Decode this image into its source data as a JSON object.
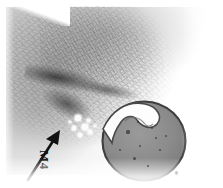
{
  "figure": {
    "type": "micrograph",
    "modality": "histology-light-micrograph",
    "stain_tone": "grayscale",
    "background_color": "#ffffff",
    "tissue_mid_tone": "#8e8e8e",
    "tissue_dark_tone": "#3a3a3a",
    "caption": ""
  },
  "annotations": {
    "label": {
      "text": "M4",
      "orientation": "rotated-90-clockwise",
      "color": "#111111",
      "x": 58,
      "y": 150
    },
    "arrow": {
      "name": "pointer-arrow",
      "color": "#111111",
      "tail_x": 30,
      "tail_y": 178,
      "tip_x": 60,
      "tip_y": 132,
      "direction": "up-right"
    },
    "speck": {
      "name": "dust-speck",
      "x": 176,
      "y": 172
    }
  },
  "structures": {
    "round_body": {
      "name": "round-follicular-body",
      "outline_color": "#3d3d3d",
      "fill_color": "#8b8b8b",
      "cx": 144,
      "cy": 140,
      "rx": 43,
      "ry": 42
    },
    "hook": {
      "name": "internal-hook-structure",
      "fill_color": "#fdfdfd",
      "outline_color": "#4a4a4a"
    },
    "lesion_band": {
      "name": "dark-diagonal-lesion-band",
      "color": "#2e2e2e",
      "angle_deg": 11
    },
    "bone_field": {
      "name": "trabecular-bone-field",
      "texture": "speckled"
    },
    "vacuoles": [
      {
        "x": 78,
        "y": 118,
        "r": 3.2
      },
      {
        "x": 85,
        "y": 127,
        "r": 2.6
      },
      {
        "x": 80,
        "y": 135,
        "r": 2.2
      },
      {
        "x": 90,
        "y": 132,
        "r": 1.8
      },
      {
        "x": 74,
        "y": 128,
        "r": 1.6
      },
      {
        "x": 88,
        "y": 120,
        "r": 1.5
      },
      {
        "x": 95,
        "y": 126,
        "r": 1.4
      },
      {
        "x": 70,
        "y": 122,
        "r": 1.3
      }
    ],
    "interior_specks": [
      {
        "x": 128,
        "y": 132,
        "r": 1.6
      },
      {
        "x": 140,
        "y": 146,
        "r": 1.3
      },
      {
        "x": 152,
        "y": 128,
        "r": 1.2
      },
      {
        "x": 134,
        "y": 158,
        "r": 1.5
      },
      {
        "x": 160,
        "y": 150,
        "r": 1.1
      },
      {
        "x": 148,
        "y": 166,
        "r": 1.2
      },
      {
        "x": 120,
        "y": 150,
        "r": 1.0
      },
      {
        "x": 156,
        "y": 138,
        "r": 1.0
      },
      {
        "x": 138,
        "y": 122,
        "r": 0.9
      },
      {
        "x": 166,
        "y": 136,
        "r": 0.9
      }
    ]
  }
}
